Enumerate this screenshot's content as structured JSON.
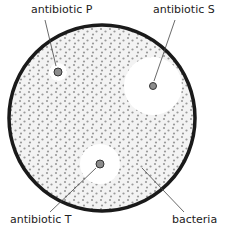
{
  "diagram": {
    "type": "agar-plate-antibiotic-test",
    "plate": {
      "cx": 102,
      "cy": 118,
      "r": 93,
      "fill": "#f3f3f3",
      "stroke": "#1a1a1a"
    },
    "bacteria_color": "#9a9a9a",
    "disk_color": "#8c8c8c",
    "labels": {
      "antibiotic_p": "antibiotic P",
      "antibiotic_s": "antibiotic S",
      "antibiotic_t": "antibiotic T",
      "bacteria": "bacteria"
    },
    "disks": [
      {
        "name": "P",
        "cx": 58,
        "cy": 72,
        "clear_zone_r": 9
      },
      {
        "name": "S",
        "cx": 153,
        "cy": 86,
        "clear_zone_r": 29
      },
      {
        "name": "T",
        "cx": 100,
        "cy": 164,
        "clear_zone_r": 20
      }
    ]
  }
}
